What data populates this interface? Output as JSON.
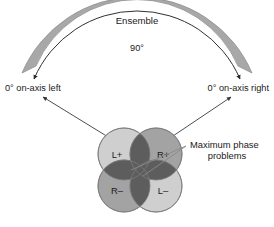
{
  "figure": {
    "type": "acoustic-coverage-diagram",
    "background_color": "#ffffff"
  },
  "arc_band": {
    "label": "Ensemble",
    "fill_color": "#a8a8a8",
    "stroke_color": "#8f8f8f"
  },
  "angle_arc": {
    "label": "90°",
    "stroke_color": "#1a1a1a",
    "arrowheads": "both"
  },
  "endpoints": {
    "left_label": "0° on-axis left",
    "right_label": "0° on-axis right"
  },
  "callout": {
    "line1": "Maximum phase",
    "line2": "problems",
    "leader_color": "#6e6e6e"
  },
  "lobes": {
    "light_fill": "#cfcfcf",
    "medium_fill": "#a3a3a3",
    "overlap_fill": "#5d5d5d",
    "stroke_color": "#7a7a7a",
    "items": [
      {
        "id": "top-left",
        "label": "L+",
        "shade": "light"
      },
      {
        "id": "top-right",
        "label": "R+",
        "shade": "medium"
      },
      {
        "id": "bottom-left",
        "label": "R–",
        "shade": "medium"
      },
      {
        "id": "bottom-right",
        "label": "L–",
        "shade": "light"
      }
    ]
  },
  "pointer_arrows": {
    "count": 2,
    "stroke_color": "#3a3a3a",
    "description": "arrows from driver cluster to on-axis labels"
  }
}
